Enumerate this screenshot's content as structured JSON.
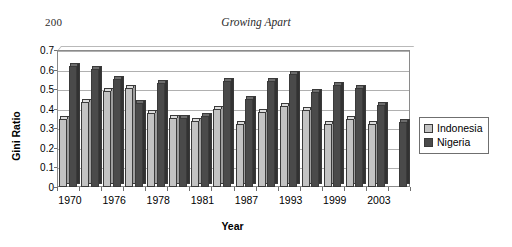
{
  "page": {
    "page_number": "200",
    "running_head": "Growing Apart"
  },
  "legend": {
    "position": "right",
    "items": [
      {
        "label": "Indonesia",
        "color": "#c3c3c3"
      },
      {
        "label": "Nigeria",
        "color": "#4a4a4a"
      }
    ]
  },
  "chart_data": {
    "type": "bar",
    "title": "",
    "subtitle": "",
    "xlabel": "Year",
    "ylabel": "Gini Ratio",
    "ylim": [
      0,
      0.7
    ],
    "ytick_labels": [
      "0",
      "0.1",
      "0.2",
      "0.3",
      "0.4",
      "0.5",
      "0.6",
      "0.7"
    ],
    "ytick_values": [
      0,
      0.1,
      0.2,
      0.3,
      0.4,
      0.5,
      0.6,
      0.7
    ],
    "grid": true,
    "legend_position": "right",
    "categories": [
      "1970",
      "",
      "1976",
      "",
      "1978",
      "",
      "1981",
      "",
      "1987",
      "",
      "1993",
      "",
      "1999",
      "",
      "2003",
      ""
    ],
    "xtick_labels": [
      "1970",
      "1976",
      "1978",
      "1981",
      "1987",
      "1993",
      "1999",
      "2003"
    ],
    "xtick_label_indices": [
      0,
      2,
      4,
      6,
      8,
      10,
      12,
      14
    ],
    "series": [
      {
        "name": "Indonesia",
        "color": "#c3c3c3",
        "values": [
          0.345,
          0.435,
          0.49,
          0.505,
          0.38,
          0.355,
          0.335,
          0.4,
          0.32,
          0.385,
          0.415,
          0.395,
          0.32,
          0.345,
          0.32,
          null
        ]
      },
      {
        "name": "Nigeria",
        "color": "#4a4a4a",
        "values": [
          0.62,
          0.605,
          0.55,
          0.43,
          0.53,
          0.355,
          0.365,
          0.54,
          0.45,
          0.54,
          0.575,
          0.485,
          0.52,
          0.505,
          0.42,
          0.33
        ]
      }
    ]
  }
}
